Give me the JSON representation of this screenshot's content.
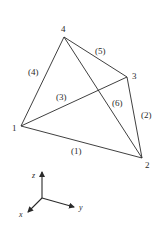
{
  "diagram": {
    "title": "",
    "colors": {
      "line": "#2a2a2a",
      "background": "#ffffff"
    },
    "nodes": [
      {
        "id": "1",
        "label": "1",
        "x": 21,
        "y": 126,
        "label_x": 12,
        "label_y": 131
      },
      {
        "id": "2",
        "label": "2",
        "x": 142,
        "y": 158,
        "label_x": 145,
        "label_y": 168
      },
      {
        "id": "3",
        "label": "3",
        "x": 127,
        "y": 77,
        "label_x": 132,
        "label_y": 79
      },
      {
        "id": "4",
        "label": "4",
        "x": 64,
        "y": 37,
        "label_x": 61,
        "label_y": 32
      }
    ],
    "edges": [
      {
        "id": "e1",
        "label": "(1)",
        "from": "1",
        "to": "2",
        "label_x": 71,
        "label_y": 154
      },
      {
        "id": "e2",
        "label": "(2)",
        "from": "3",
        "to": "2",
        "label_x": 141,
        "label_y": 118
      },
      {
        "id": "e3",
        "label": "(3)",
        "from": "1",
        "to": "3",
        "label_x": 56,
        "label_y": 100
      },
      {
        "id": "e4",
        "label": "(4)",
        "from": "1",
        "to": "4",
        "label_x": 28,
        "label_y": 75
      },
      {
        "id": "e5",
        "label": "(5)",
        "from": "4",
        "to": "3",
        "label_x": 95,
        "label_y": 54
      },
      {
        "id": "e6",
        "label": "(6)",
        "from": "4",
        "to": "2",
        "label_x": 112,
        "label_y": 106
      }
    ],
    "axes": {
      "origin": {
        "x": 42,
        "y": 198
      },
      "items": [
        {
          "id": "z",
          "label": "z",
          "x2": 42,
          "y2": 172,
          "label_x": 32,
          "label_y": 178
        },
        {
          "id": "y",
          "label": "y",
          "x2": 74,
          "y2": 207,
          "label_x": 79,
          "label_y": 210
        },
        {
          "id": "x",
          "label": "x",
          "x2": 28,
          "y2": 212,
          "label_x": 19,
          "label_y": 217
        }
      ]
    }
  }
}
